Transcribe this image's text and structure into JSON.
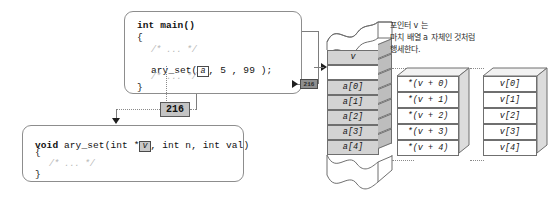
{
  "figure": {
    "background_color": "#ffffff",
    "accent_gray": "#c4c4c4",
    "line_color": "#7d7d7d"
  },
  "caller_code": {
    "name": "main-function-code",
    "line1": "int main()",
    "line2": "{",
    "comment_top": "/* ... */",
    "call_prefix": "ary_set(",
    "call_arg_boxed": "a",
    "call_suffix": ", 5 , 99 );",
    "comment_bottom": "/* ... */",
    "line_close": "}"
  },
  "callee_code": {
    "name": "ary-set-function-code",
    "sig_kw": "void",
    "sig_name": " ary_set(",
    "sig_param1_pre": "int *",
    "sig_param1_boxed": "v",
    "sig_rest": ", int n, int val)",
    "line_open": "{",
    "comment": "/* ... */",
    "line_close": "}"
  },
  "pointer_value": {
    "label": "216",
    "small_label": "216"
  },
  "memory": {
    "title": "memory-column",
    "cells": [
      {
        "label": "v",
        "kind": "pointer"
      },
      {
        "label": "",
        "kind": "empty"
      },
      {
        "label": "a[0]",
        "kind": "array"
      },
      {
        "label": "a[1]",
        "kind": "array"
      },
      {
        "label": "a[2]",
        "kind": "array"
      },
      {
        "label": "a[3]",
        "kind": "array"
      },
      {
        "label": "a[4]",
        "kind": "array"
      }
    ]
  },
  "deref_table": {
    "name": "pointer-arithmetic-table",
    "rows": [
      "*(v + 0)",
      "*(v + 1)",
      "*(v + 2)",
      "*(v + 3)",
      "*(v + 4)"
    ]
  },
  "index_table": {
    "name": "pointer-index-table",
    "rows": [
      "v[0]",
      "v[1]",
      "v[2]",
      "v[3]",
      "v[4]"
    ]
  },
  "caption": {
    "line1": "포인터 v 는",
    "line2": "마치 배열 a 자체인 것처럼",
    "line3": "행세한다."
  }
}
